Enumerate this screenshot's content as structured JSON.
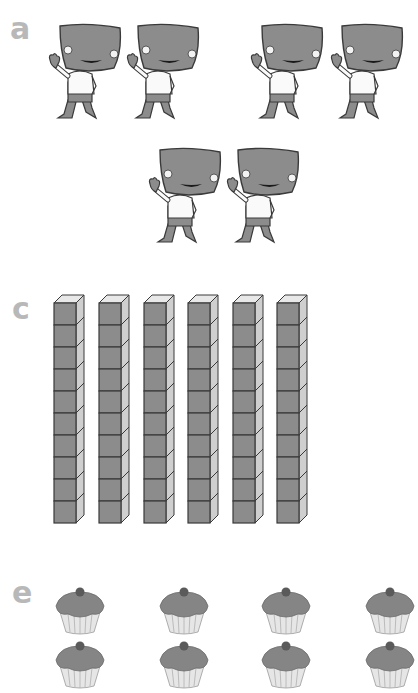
{
  "sections": [
    {
      "label": "a",
      "item": "character",
      "count": 6,
      "groups": [
        2,
        2,
        2
      ],
      "description": "Cartoon characters with large grey square heads, waving"
    },
    {
      "label": "c",
      "item": "ten-rod",
      "count": 6,
      "cubes_per_rod": 10,
      "description": "Base-ten rods of 10 cubes each"
    },
    {
      "label": "e",
      "item": "cupcake",
      "visible_rows": 2,
      "visible_per_row": 4,
      "description": "Grey cupcakes arranged in rows (cropped at bottom and right)"
    }
  ],
  "colors": {
    "label": "#b8b8b8",
    "fill": "#8c8c8c",
    "outline": "#3a3a3a",
    "light": "#e8e8e8",
    "side": "#cfcfcf"
  }
}
